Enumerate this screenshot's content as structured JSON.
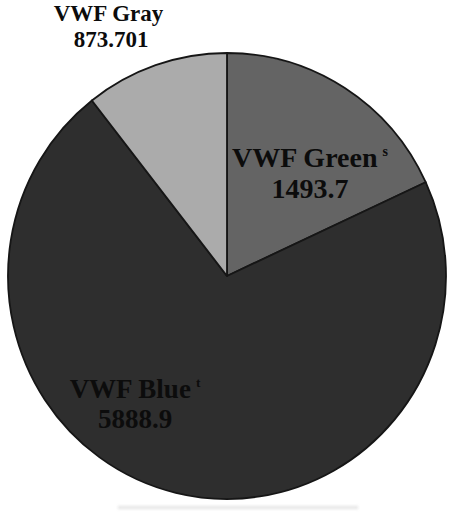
{
  "figure": {
    "background": "#ffffff",
    "text_color": "#0c0c0c"
  },
  "chart_data": {
    "type": "pie",
    "title": "",
    "start_angle_deg": 0,
    "direction": "clockwise",
    "outline_color": "#161616",
    "legend": "none",
    "slices": [
      {
        "label": "VWF Green",
        "value": 1493.7,
        "display_value": "1493.7",
        "footnote_marker": "s",
        "color": "#646464",
        "label_placement": "inside"
      },
      {
        "label": "VWF Blue",
        "value": 5888.9,
        "display_value": "5888.9",
        "footnote_marker": "t",
        "color": "#2e2e2e",
        "label_placement": "inside"
      },
      {
        "label": "VWF Gray",
        "value": 873.701,
        "display_value": "873.701",
        "footnote_marker": "",
        "color": "#ababab",
        "label_placement": "outside-top-left"
      }
    ]
  }
}
